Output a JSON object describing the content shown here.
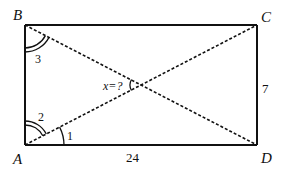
{
  "diagram": {
    "type": "rectangle-with-diagonals",
    "vertices": {
      "A": {
        "label": "A",
        "x": 25,
        "y": 145
      },
      "B": {
        "label": "B",
        "x": 25,
        "y": 25
      },
      "C": {
        "label": "C",
        "x": 257,
        "y": 25
      },
      "D": {
        "label": "D",
        "x": 257,
        "y": 145
      }
    },
    "sides": {
      "AD": {
        "label": "24"
      },
      "CD": {
        "label": "7"
      }
    },
    "diagonals": [
      "AC",
      "BD"
    ],
    "angles": {
      "angle1": {
        "label": "1",
        "at": "A",
        "between": "AD-AC",
        "arcs": 1
      },
      "angle2": {
        "label": "2",
        "at": "A",
        "between": "AC-AB",
        "arcs": 2
      },
      "angle3": {
        "label": "3",
        "at": "B",
        "between": "BA-BD",
        "arcs": 2
      },
      "angle_x": {
        "label": "x=?",
        "at": "intersection",
        "arcs": 1
      }
    },
    "colors": {
      "stroke": "#111111",
      "background": "#ffffff"
    }
  }
}
